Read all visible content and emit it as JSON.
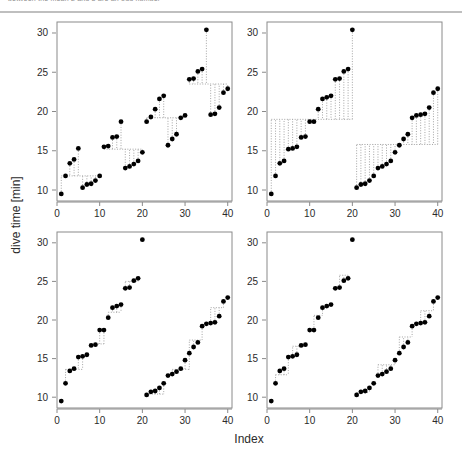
{
  "figure": {
    "top_cut_text": "between the mean 2 and 8 are an odd number",
    "xlabel": "Index",
    "ylabel": "dive time [min]",
    "axis_color": "#8a8a8a",
    "point_color": "#000000",
    "connector_color": "#9a9a9a",
    "background": "#ffffff"
  },
  "chart_data": {
    "type": "scatter",
    "title": "",
    "xlabel": "Index",
    "ylabel": "dive time [min]",
    "xlim": [
      0,
      41
    ],
    "ylim": [
      8.6,
      31.4
    ],
    "xticks": [
      0,
      10,
      20,
      30,
      40
    ],
    "yticks": [
      10,
      15,
      20,
      25,
      30
    ],
    "grid": false,
    "legend": null,
    "panel_layout": "2x2",
    "marker": "filled-circle",
    "connector_style": "dotted-step",
    "panels": [
      {
        "name": "panel-top-left",
        "row": 0,
        "col": 0,
        "description": "partially sorted runs of length 5",
        "x": [
          1,
          2,
          3,
          4,
          5,
          6,
          7,
          8,
          9,
          10,
          11,
          12,
          13,
          14,
          15,
          16,
          17,
          18,
          19,
          20,
          21,
          22,
          23,
          24,
          25,
          26,
          27,
          28,
          29,
          30,
          31,
          32,
          33,
          34,
          35,
          36,
          37,
          38,
          39,
          40
        ],
        "values": [
          9.5,
          11.8,
          13.4,
          13.9,
          15.3,
          10.3,
          10.7,
          10.8,
          11.2,
          11.8,
          15.5,
          15.6,
          16.7,
          16.8,
          18.7,
          12.8,
          13.0,
          13.3,
          13.7,
          14.8,
          18.7,
          19.3,
          20.3,
          21.6,
          22.0,
          15.7,
          16.5,
          17.1,
          19.2,
          19.5,
          24.1,
          24.2,
          25.1,
          25.4,
          30.4,
          19.6,
          19.7,
          20.5,
          22.4,
          22.9
        ],
        "steps": [
          {
            "y": 11.8,
            "x0": 1,
            "x1": 10
          },
          {
            "y": 15.2,
            "x0": 11,
            "x1": 20
          },
          {
            "y": 19.2,
            "x0": 21,
            "x1": 30
          },
          {
            "y": 23.5,
            "x0": 31,
            "x1": 40
          }
        ]
      },
      {
        "name": "panel-top-right",
        "row": 0,
        "col": 1,
        "description": "two sorted halves of length 20",
        "x": [
          1,
          2,
          3,
          4,
          5,
          6,
          7,
          8,
          9,
          10,
          11,
          12,
          13,
          14,
          15,
          16,
          17,
          18,
          19,
          20,
          21,
          22,
          23,
          24,
          25,
          26,
          27,
          28,
          29,
          30,
          31,
          32,
          33,
          34,
          35,
          36,
          37,
          38,
          39,
          40
        ],
        "values": [
          9.5,
          11.8,
          13.4,
          13.7,
          15.2,
          15.3,
          15.5,
          16.7,
          16.8,
          18.7,
          18.7,
          20.3,
          21.6,
          21.8,
          22.0,
          24.1,
          24.2,
          25.1,
          25.4,
          30.4,
          10.3,
          10.7,
          10.8,
          11.2,
          11.8,
          12.8,
          13.0,
          13.3,
          13.7,
          14.8,
          15.7,
          16.5,
          17.1,
          19.2,
          19.5,
          19.6,
          19.7,
          20.5,
          22.4,
          22.9
        ],
        "steps": [
          {
            "y": 19.0,
            "x0": 1,
            "x1": 20
          },
          {
            "y": 15.8,
            "x0": 21,
            "x1": 40
          }
        ]
      },
      {
        "name": "panel-bottom-left",
        "row": 1,
        "col": 0,
        "description": "two sorted halves, narrow step connectors",
        "x": [
          1,
          2,
          3,
          4,
          5,
          6,
          7,
          8,
          9,
          10,
          11,
          12,
          13,
          14,
          15,
          16,
          17,
          18,
          19,
          20,
          21,
          22,
          23,
          24,
          25,
          26,
          27,
          28,
          29,
          30,
          31,
          32,
          33,
          34,
          35,
          36,
          37,
          38,
          39,
          40
        ],
        "values": [
          9.5,
          11.8,
          13.4,
          13.7,
          15.2,
          15.3,
          15.5,
          16.7,
          16.8,
          18.7,
          18.7,
          20.3,
          21.6,
          21.8,
          22.0,
          24.1,
          24.2,
          25.1,
          25.4,
          30.4,
          10.3,
          10.7,
          10.8,
          11.2,
          11.8,
          12.8,
          13.0,
          13.3,
          13.7,
          14.8,
          15.7,
          16.5,
          17.1,
          19.2,
          19.5,
          19.6,
          19.7,
          20.5,
          22.4,
          22.9
        ],
        "steps": [
          {
            "y": 13.6,
            "x0": 2,
            "x1": 6
          },
          {
            "y": 16.9,
            "x0": 9,
            "x1": 11
          },
          {
            "y": 21.0,
            "x0": 12,
            "x1": 15
          },
          {
            "y": 25.0,
            "x0": 16,
            "x1": 19
          },
          {
            "y": 10.4,
            "x0": 21,
            "x1": 25
          },
          {
            "y": 13.6,
            "x0": 27,
            "x1": 31
          },
          {
            "y": 17.4,
            "x0": 31,
            "x1": 34
          },
          {
            "y": 21.6,
            "x0": 36,
            "x1": 39
          }
        ]
      },
      {
        "name": "panel-bottom-right",
        "row": 1,
        "col": 1,
        "description": "two sorted halves, narrow step connectors variant",
        "x": [
          1,
          2,
          3,
          4,
          5,
          6,
          7,
          8,
          9,
          10,
          11,
          12,
          13,
          14,
          15,
          16,
          17,
          18,
          19,
          20,
          21,
          22,
          23,
          24,
          25,
          26,
          27,
          28,
          29,
          30,
          31,
          32,
          33,
          34,
          35,
          36,
          37,
          38,
          39,
          40
        ],
        "values": [
          9.5,
          11.8,
          13.4,
          13.7,
          15.2,
          15.3,
          15.5,
          16.7,
          16.8,
          18.7,
          18.7,
          20.3,
          21.6,
          21.8,
          22.0,
          24.1,
          24.2,
          25.1,
          25.4,
          30.4,
          10.3,
          10.7,
          10.8,
          11.2,
          11.8,
          12.8,
          13.0,
          13.3,
          13.7,
          14.8,
          15.7,
          16.5,
          17.1,
          19.2,
          19.5,
          19.6,
          19.7,
          20.5,
          22.4,
          22.9
        ],
        "steps": [
          {
            "y": 12.9,
            "x0": 2,
            "x1": 5
          },
          {
            "y": 16.6,
            "x0": 6,
            "x1": 9
          },
          {
            "y": 20.6,
            "x0": 11,
            "x1": 13
          },
          {
            "y": 25.8,
            "x0": 17,
            "x1": 19
          },
          {
            "y": 10.6,
            "x0": 21,
            "x1": 24
          },
          {
            "y": 14.2,
            "x0": 26,
            "x1": 30
          },
          {
            "y": 17.8,
            "x0": 31,
            "x1": 34
          },
          {
            "y": 21.2,
            "x0": 36,
            "x1": 39
          }
        ]
      }
    ]
  }
}
